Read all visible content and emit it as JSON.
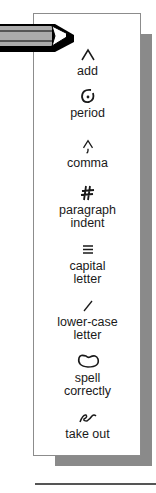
{
  "colors": {
    "shadow": "#8a8a8a",
    "pencil_body": "#aaaaaa",
    "border": "#8c8c8c",
    "text": "#1a1a1a"
  },
  "marks": [
    {
      "icon": "caret-icon",
      "label": "add"
    },
    {
      "icon": "circled-dot-icon",
      "label": "period"
    },
    {
      "icon": "caret-comma-icon",
      "label": "comma"
    },
    {
      "icon": "paragraph-indent-icon",
      "label": "paragraph indent"
    },
    {
      "icon": "triple-underline-icon",
      "label": "capital letter"
    },
    {
      "icon": "slash-icon",
      "label": "lower-case letter"
    },
    {
      "icon": "loop-circle-icon",
      "label": "spell correctly"
    },
    {
      "icon": "delete-squiggle-icon",
      "label": "take out"
    }
  ]
}
